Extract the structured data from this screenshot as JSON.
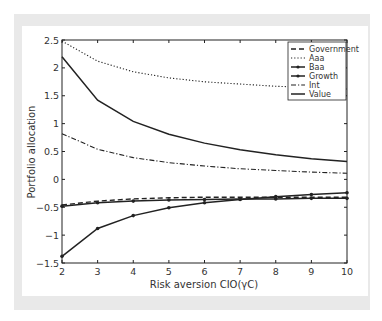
{
  "chart_data": {
    "type": "line",
    "title": "",
    "xlabel": "Risk aversion CIO(γC)",
    "ylabel": "Portfolio allocation",
    "x": [
      2,
      3,
      4,
      5,
      6,
      7,
      8,
      9,
      10
    ],
    "xlim": [
      2,
      10
    ],
    "ylim": [
      -1.5,
      2.5
    ],
    "xticks": [
      "2",
      "3",
      "4",
      "5",
      "6",
      "7",
      "8",
      "9",
      "10"
    ],
    "yticks": [
      "-1.5",
      "-1",
      "-0.5",
      "0",
      "0.5",
      "1",
      "1.5",
      "2",
      "2.5"
    ],
    "grid": false,
    "legend_position": "upper right",
    "series": [
      {
        "name": "Government",
        "style": "dashed",
        "values": [
          -0.46,
          -0.39,
          -0.35,
          -0.33,
          -0.32,
          -0.32,
          -0.32,
          -0.32,
          -0.32
        ]
      },
      {
        "name": "Aaa",
        "style": "dotted",
        "values": [
          2.48,
          2.12,
          1.93,
          1.82,
          1.75,
          1.71,
          1.67,
          1.65,
          1.62
        ]
      },
      {
        "name": "Baa",
        "style": "solid-marker",
        "values": [
          -0.48,
          -0.42,
          -0.39,
          -0.37,
          -0.36,
          -0.35,
          -0.35,
          -0.34,
          -0.34
        ]
      },
      {
        "name": "Growth",
        "style": "solid-marker",
        "values": [
          -1.38,
          -0.88,
          -0.65,
          -0.51,
          -0.42,
          -0.36,
          -0.31,
          -0.27,
          -0.24
        ]
      },
      {
        "name": "Int",
        "style": "dashdot",
        "values": [
          0.82,
          0.54,
          0.39,
          0.3,
          0.24,
          0.19,
          0.16,
          0.13,
          0.11
        ]
      },
      {
        "name": "Value",
        "style": "solid",
        "values": [
          2.2,
          1.42,
          1.04,
          0.81,
          0.65,
          0.53,
          0.44,
          0.37,
          0.32
        ]
      }
    ]
  }
}
